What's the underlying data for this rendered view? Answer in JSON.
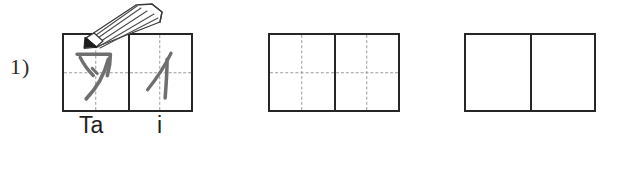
{
  "exercise": {
    "number_label": "1)",
    "script": "katakana",
    "word_romaji": "Tai"
  },
  "colors": {
    "ink": "#262626",
    "guide_dash": "#9b9b9b",
    "pencil_stroke": "#8a8a8a",
    "background": "#ffffff"
  },
  "groups": [
    {
      "id": "grid-group-1",
      "name": "model-group",
      "has_guides": true,
      "filled": true,
      "cells": [
        {
          "character": "タ",
          "romaji": "Ta",
          "guides": true,
          "written": true
        },
        {
          "character": "イ",
          "romaji": "i",
          "guides": true,
          "written": true
        }
      ]
    },
    {
      "id": "grid-group-2",
      "name": "guided-practice-group",
      "has_guides": true,
      "filled": false,
      "cells": [
        {
          "character": "",
          "romaji": "",
          "guides": true,
          "written": false
        },
        {
          "character": "",
          "romaji": "",
          "guides": true,
          "written": false
        }
      ]
    },
    {
      "id": "grid-group-3",
      "name": "blank-practice-group",
      "has_guides": false,
      "filled": false,
      "cells": [
        {
          "character": "",
          "romaji": "",
          "guides": false,
          "written": false
        },
        {
          "character": "",
          "romaji": "",
          "guides": false,
          "written": false
        }
      ]
    }
  ],
  "labels": {
    "ta": "Ta",
    "i": "i"
  },
  "icons": {
    "pencil": "pencil-icon"
  }
}
